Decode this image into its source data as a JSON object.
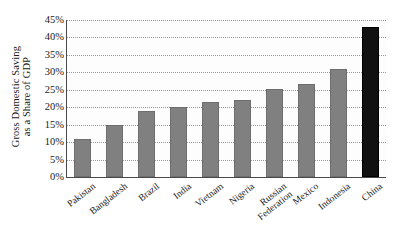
{
  "chart_data": {
    "type": "bar",
    "title": "",
    "subtitle": "",
    "xlabel": "",
    "ylabel": "Gross Domestic Saving as a Share of GDP",
    "ylabel_lines": [
      "Gross Domestic Saving",
      "as a Share of GDP"
    ],
    "categories": [
      "Pakistan",
      "Bangladesh",
      "Brazil",
      "India",
      "Vietnam",
      "Nigeria",
      "Russian Federation",
      "Mexico",
      "Indonesia",
      "China"
    ],
    "category_lines": [
      [
        "Pakistan"
      ],
      [
        "Bangladesh"
      ],
      [
        "Brazil"
      ],
      [
        "India"
      ],
      [
        "Vietnam"
      ],
      [
        "Nigeria"
      ],
      [
        "Russian",
        "Federation"
      ],
      [
        "Mexico"
      ],
      [
        "Indonesia"
      ],
      [
        "China"
      ]
    ],
    "values": [
      10.8,
      14.8,
      19.0,
      20.2,
      21.4,
      22.2,
      25.2,
      26.8,
      31.0,
      43.0
    ],
    "value_labels": [
      "10.8%",
      "14.8%",
      "19.0%",
      "20.2%",
      "21.4%",
      "22.2%",
      "25.2%",
      "26.8%",
      "31.0%",
      "43.0%"
    ],
    "highlight_index": 9,
    "ylim": [
      0,
      45
    ],
    "yticks": [
      0,
      5,
      10,
      15,
      20,
      25,
      30,
      35,
      40,
      45
    ],
    "ytick_labels": [
      "0%",
      "5%",
      "10%",
      "15%",
      "20%",
      "25%",
      "30%",
      "35%",
      "40%",
      "45%"
    ],
    "grid": true,
    "grid_style": "dotted horizontal",
    "legend": null,
    "legend_position": "none",
    "colors": {
      "bar": "#808080",
      "bar_highlight": "#111111",
      "axis": "#4a4a4a",
      "gridline": "#9a9a9a",
      "text": "#1a1a1a",
      "background": "#ffffff",
      "plot_background": "#fdfdfd"
    }
  }
}
